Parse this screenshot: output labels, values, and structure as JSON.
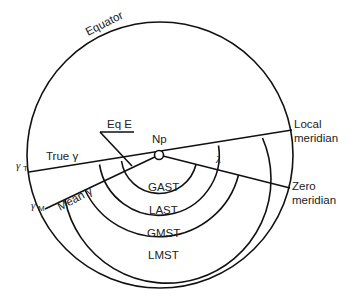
{
  "diagram": {
    "labels": {
      "equator": "Equator",
      "eq_e": "Eq E",
      "np": "Np",
      "lambda": "λ",
      "true_gamma": "True γ",
      "mean_gamma": "Mean γ",
      "gamma_t": "γ",
      "gamma_t_sub": "T",
      "gamma_m": "γ",
      "gamma_m_sub": "M",
      "local_meridian_1": "Local",
      "local_meridian_2": "meridian",
      "zero_meridian_1": "Zero",
      "zero_meridian_2": "meridian"
    },
    "arcs": [
      {
        "name": "GAST",
        "label": "GAST",
        "from": "True γ",
        "to": "Zero meridian"
      },
      {
        "name": "LAST",
        "label": "LAST",
        "from": "True γ",
        "to": "Local meridian"
      },
      {
        "name": "GMST",
        "label": "GMST",
        "from": "Mean γ",
        "to": "Zero meridian"
      },
      {
        "name": "LMST",
        "label": "LMST",
        "from": "Mean γ",
        "to": "Local meridian"
      }
    ],
    "colors": {
      "line": "#111111",
      "text": "#222222",
      "background": "#ffffff"
    }
  }
}
